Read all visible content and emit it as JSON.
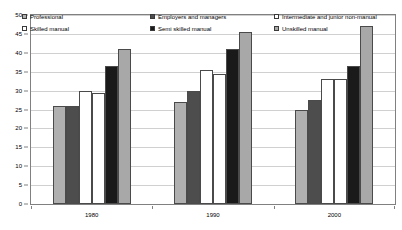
{
  "chart_data": {
    "type": "bar",
    "title": "",
    "xlabel": "",
    "ylabel": "",
    "ylim": [
      0,
      50
    ],
    "ytick_step": 5,
    "yticks": [
      "0",
      "5",
      "10",
      "15",
      "20",
      "25",
      "30",
      "35",
      "40",
      "45",
      "50"
    ],
    "grid": true,
    "legend_position": "top-inside",
    "categories": [
      "1980",
      "1990",
      "2000"
    ],
    "series": [
      {
        "name": "Professional",
        "color": "#b0b0b0",
        "values": [
          26,
          27,
          25
        ]
      },
      {
        "name": "Employers and managers",
        "color": "#4d4d4d",
        "values": [
          26,
          30,
          27.5
        ]
      },
      {
        "name": "Intermediate and junior non-manual",
        "color": "#ffffff",
        "values": [
          30,
          35.5,
          33
        ]
      },
      {
        "name": "Skilled manual",
        "color": "#ffffff",
        "values": [
          29.5,
          34.5,
          33
        ]
      },
      {
        "name": "Semi skilled manual",
        "color": "#1a1a1a",
        "values": [
          36.5,
          41,
          36.5
        ]
      },
      {
        "name": "Unskilled manual",
        "color": "#a8a8a8",
        "values": [
          41,
          45.5,
          47
        ]
      }
    ]
  },
  "legend": {
    "columns": [
      {
        "items": [
          {
            "label": "Professional",
            "swatch": "#b0b0b0",
            "icon": "legend-swatch-icon"
          },
          {
            "label": "Skilled manual",
            "swatch": "#ffffff",
            "icon": "legend-swatch-icon"
          }
        ]
      },
      {
        "items": [
          {
            "label": "Employers and managers",
            "swatch": "#4d4d4d",
            "icon": "legend-swatch-icon"
          },
          {
            "label": "Semi skilled manual",
            "swatch": "#1a1a1a",
            "icon": "legend-swatch-icon"
          }
        ]
      },
      {
        "items": [
          {
            "label": "Intermediate and junior non-manual",
            "swatch": "#ffffff",
            "icon": "legend-swatch-icon"
          },
          {
            "label": "Unskilled manual",
            "swatch": "#a8a8a8",
            "icon": "legend-swatch-icon"
          }
        ]
      }
    ]
  },
  "colors": {
    "frame": "#808080",
    "grid": "#d0d0d0",
    "bar_border": "#4a4a4a",
    "background": "#ffffff",
    "text": "#000000"
  }
}
